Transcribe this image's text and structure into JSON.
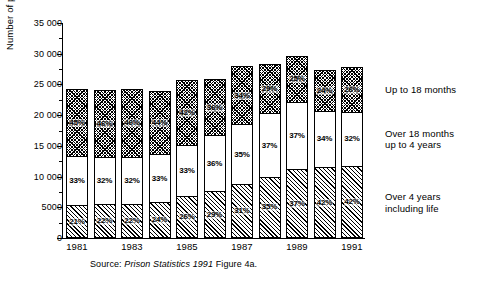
{
  "axis": {
    "ylabel": "Number of persons",
    "yticks": [
      "35 000",
      "30 000",
      "25 000",
      "20 000",
      "15 000",
      "10 000",
      "5000",
      "0"
    ]
  },
  "legend": [
    {
      "key": "top",
      "label_line1": "Up to 18 months",
      "label_line2": ""
    },
    {
      "key": "mid",
      "label_line1": "Over 18 months",
      "label_line2": "up to 4 years"
    },
    {
      "key": "bot",
      "label_line1": "Over 4 years",
      "label_line2": "including life"
    }
  ],
  "source": {
    "prefix": "Source: ",
    "italic": "Prison Statistics 1991",
    "suffix": " Figure 4a."
  },
  "chart_data": {
    "type": "bar",
    "title": "",
    "xlabel": "",
    "ylabel": "Number of persons",
    "ylim": [
      0,
      35000
    ],
    "ytick_values": [
      0,
      5000,
      10000,
      15000,
      20000,
      25000,
      30000,
      35000
    ],
    "minor_tick_interval": 2500,
    "grid": false,
    "legend_position": "right",
    "stacked": true,
    "categories": [
      "1981",
      "1982",
      "1983",
      "1984",
      "1985",
      "1986",
      "1987",
      "1988",
      "1989",
      "1990",
      "1991"
    ],
    "xtick_labels_shown": [
      "1981",
      "1983",
      "1985",
      "1987",
      "1989",
      "1991"
    ],
    "totals": [
      24300,
      24100,
      24300,
      23900,
      25700,
      25900,
      28000,
      28400,
      29700,
      27300,
      27800
    ],
    "series": [
      {
        "name": "Over 4 years including life",
        "key": "bot",
        "percent_labels": [
          "21%",
          "22%",
          "22%",
          "24%",
          "26%",
          "29%",
          "31%",
          "35%",
          "37%",
          "42%",
          "42%"
        ],
        "values": [
          21,
          22,
          22,
          24,
          26,
          29,
          31,
          35,
          37,
          42,
          42
        ]
      },
      {
        "name": "Over 18 months up to 4 years",
        "key": "mid",
        "percent_labels": [
          "33%",
          "32%",
          "32%",
          "33%",
          "33%",
          "36%",
          "35%",
          "37%",
          "37%",
          "34%",
          "32%"
        ],
        "values": [
          33,
          32,
          32,
          33,
          33,
          36,
          35,
          37,
          37,
          34,
          32
        ]
      },
      {
        "name": "Up to 18 months",
        "key": "top",
        "percent_labels": [
          "45%",
          "46%",
          "46%",
          "44%",
          "42%",
          "36%",
          "34%",
          "29%",
          "25%",
          "24%",
          "26%"
        ],
        "values": [
          45,
          46,
          46,
          44,
          42,
          36,
          34,
          29,
          25,
          24,
          26
        ]
      }
    ]
  }
}
